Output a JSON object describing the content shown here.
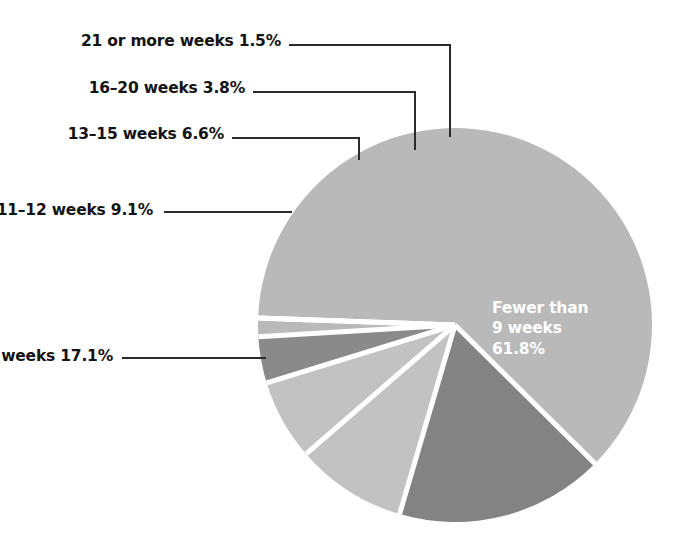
{
  "chart_data": {
    "type": "pie",
    "title": "",
    "subtitle": "",
    "xlabel": "",
    "ylabel": "",
    "legend_position": "none",
    "grid": false,
    "units": "percent",
    "categories": [
      "Fewer than 9 weeks",
      "9–10 weeks",
      "11–12 weeks",
      "13–15 weeks",
      "16–20 weeks",
      "21 or more weeks"
    ],
    "values": [
      61.8,
      17.1,
      9.1,
      6.6,
      3.8,
      1.5
    ],
    "slices": [
      {
        "name": "Fewer than 9 weeks",
        "value": 61.8,
        "value_text": "61.8%",
        "color": "#b9b9b9",
        "label_placement": "inside",
        "label_lines": [
          "Fewer than",
          "9 weeks",
          "61.8%"
        ]
      },
      {
        "name": "9–10 weeks",
        "value": 17.1,
        "value_text": "17.1%",
        "color": "#838383",
        "label_placement": "outside",
        "label_text": "9–10 weeks 17.1%"
      },
      {
        "name": "11–12 weeks",
        "value": 9.1,
        "value_text": "9.1%",
        "color": "#c2c2c2",
        "label_placement": "outside",
        "label_text": "11–12 weeks 9.1%"
      },
      {
        "name": "13–15 weeks",
        "value": 6.6,
        "value_text": "6.6%",
        "color": "#c2c2c2",
        "label_placement": "outside",
        "label_text": "13–15 weeks 6.6%"
      },
      {
        "name": "16–20 weeks",
        "value": 3.8,
        "value_text": "3.8%",
        "color": "#8a8a8a",
        "label_placement": "outside",
        "label_text": "16–20 weeks 3.8%"
      },
      {
        "name": "21 or more weeks",
        "value": 1.5,
        "value_text": "1.5%",
        "color": "#b9b9b9",
        "label_placement": "outside",
        "label_text": "21 or more weeks 1.5%"
      }
    ]
  },
  "labels": {
    "weeks_21_plus": "21 or more weeks 1.5%",
    "weeks_16_20": "16–20 weeks 3.8%",
    "weeks_13_15": "13–15 weeks 6.6%",
    "weeks_11_12": "11–12 weeks 9.1%",
    "weeks_9_10": "9–10 weeks 17.1%",
    "inside_line1": "Fewer than",
    "inside_line2": "9 weeks",
    "inside_line3": "61.8%"
  },
  "colors": {
    "background": "#ffffff",
    "text": "#141414",
    "inside_text": "#ffffff",
    "leader_line": "#2b2b2b",
    "slice_gap": "#ffffff",
    "slice_light": "#c2c2c2",
    "slice_main": "#b9b9b9",
    "slice_dark": "#838383",
    "slice_mid_dark": "#8a8a8a"
  }
}
